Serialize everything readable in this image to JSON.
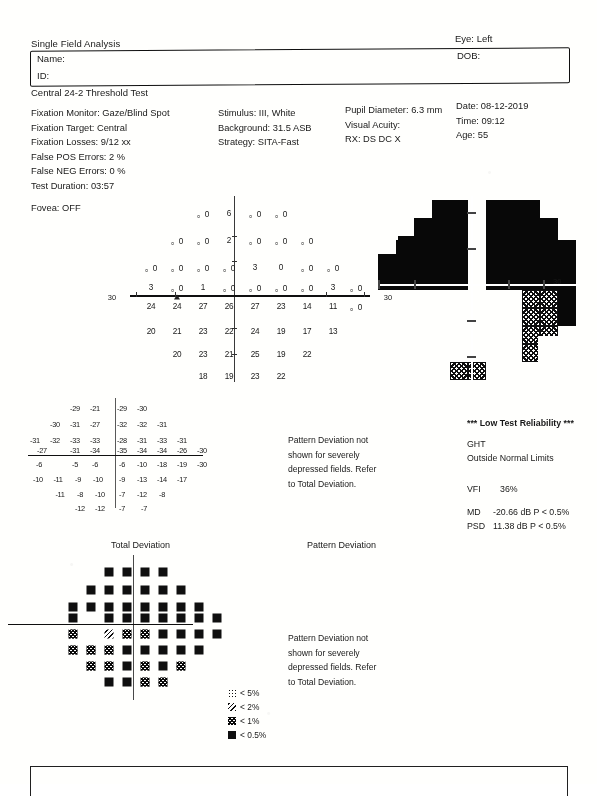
{
  "header": {
    "analysis_title": "Single Field Analysis",
    "eye_label": "Eye: Left",
    "name_label": "Name:",
    "id_label": "ID:",
    "dob_label": "DOB:",
    "test_name": "Central 24-2 Threshold Test"
  },
  "params": {
    "col1": [
      "Fixation Monitor: Gaze/Blind Spot",
      "Fixation Target: Central",
      "Fixation Losses: 9/12 xx",
      "False POS Errors:  2 %",
      "False NEG Errors:  0 %",
      "Test Duration: 03:57"
    ],
    "fovea": "Fovea: OFF",
    "col2": [
      "Stimulus: III, White",
      "Background: 31.5 ASB",
      "Strategy: SITA-Fast"
    ],
    "col3": [
      "Pupil Diameter: 6.3 mm",
      "Visual Acuity:",
      "RX:      DS        DC X"
    ],
    "col4": [
      "Date: 08-12-2019",
      "Time: 09:12",
      "Age: 55"
    ]
  },
  "threshold_plot": {
    "axis_label_left": "30",
    "axis_label_right": "30",
    "blind_spot_marker": "triangle",
    "rows": [
      {
        "y": 17,
        "cells": [
          {
            "x": 73,
            "v": "。0"
          },
          {
            "x": 99,
            "v": "6"
          },
          {
            "x": 125,
            "v": "。0"
          },
          {
            "x": 151,
            "v": "。0"
          }
        ]
      },
      {
        "y": 44,
        "cells": [
          {
            "x": 47,
            "v": "。0"
          },
          {
            "x": 73,
            "v": "。0"
          },
          {
            "x": 99,
            "v": "2"
          },
          {
            "x": 125,
            "v": "。0"
          },
          {
            "x": 151,
            "v": "。0"
          },
          {
            "x": 177,
            "v": "。0"
          }
        ]
      },
      {
        "y": 71,
        "cells": [
          {
            "x": 21,
            "v": "。0"
          },
          {
            "x": 47,
            "v": "。0"
          },
          {
            "x": 73,
            "v": "。0"
          },
          {
            "x": 99,
            "v": "。0"
          },
          {
            "x": 125,
            "v": "3"
          },
          {
            "x": 151,
            "v": "0"
          },
          {
            "x": 177,
            "v": "。0"
          },
          {
            "x": 203,
            "v": "。0"
          }
        ]
      },
      {
        "y": 91,
        "cells": [
          {
            "x": 21,
            "v": "3"
          },
          {
            "x": 47,
            "v": "。0"
          },
          {
            "x": 73,
            "v": "1"
          },
          {
            "x": 99,
            "v": "。0"
          },
          {
            "x": 125,
            "v": "。0"
          },
          {
            "x": 151,
            "v": "。0"
          },
          {
            "x": 177,
            "v": "。0"
          },
          {
            "x": 203,
            "v": "3"
          },
          {
            "x": 226,
            "v": "。0"
          }
        ]
      },
      {
        "y": 110,
        "cells": [
          {
            "x": 21,
            "v": "24"
          },
          {
            "x": 47,
            "v": "24"
          },
          {
            "x": 73,
            "v": "27"
          },
          {
            "x": 99,
            "v": "26"
          },
          {
            "x": 125,
            "v": "27"
          },
          {
            "x": 151,
            "v": "23"
          },
          {
            "x": 177,
            "v": "14"
          },
          {
            "x": 203,
            "v": "11"
          },
          {
            "x": 226,
            "v": "。0"
          }
        ]
      },
      {
        "y": 135,
        "cells": [
          {
            "x": 21,
            "v": "20"
          },
          {
            "x": 47,
            "v": "21"
          },
          {
            "x": 73,
            "v": "23"
          },
          {
            "x": 99,
            "v": "22"
          },
          {
            "x": 125,
            "v": "24"
          },
          {
            "x": 151,
            "v": "19"
          },
          {
            "x": 177,
            "v": "17"
          },
          {
            "x": 203,
            "v": "13"
          }
        ]
      },
      {
        "y": 158,
        "cells": [
          {
            "x": 47,
            "v": "20"
          },
          {
            "x": 73,
            "v": "23"
          },
          {
            "x": 99,
            "v": "21"
          },
          {
            "x": 125,
            "v": "25"
          },
          {
            "x": 151,
            "v": "19"
          },
          {
            "x": 177,
            "v": "22"
          }
        ]
      },
      {
        "y": 180,
        "cells": [
          {
            "x": 73,
            "v": "18"
          },
          {
            "x": 99,
            "v": "19"
          },
          {
            "x": 125,
            "v": "23"
          },
          {
            "x": 151,
            "v": "22"
          }
        ]
      }
    ]
  },
  "grayscale": {
    "degree_label": "30",
    "description": "Dense superior hemifield defect with inferior relative sparing"
  },
  "total_deviation_numeric": {
    "rows": [
      {
        "y": 10,
        "cells": [
          {
            "x": 57,
            "v": "-29"
          },
          {
            "x": 77,
            "v": "-21"
          },
          {
            "x": 104,
            "v": "-29"
          },
          {
            "x": 124,
            "v": "-30"
          }
        ]
      },
      {
        "y": 26,
        "cells": [
          {
            "x": 37,
            "v": "-30"
          },
          {
            "x": 57,
            "v": "-31"
          },
          {
            "x": 77,
            "v": "-27"
          },
          {
            "x": 104,
            "v": "-32"
          },
          {
            "x": 124,
            "v": "-32"
          },
          {
            "x": 144,
            "v": "-31"
          }
        ]
      },
      {
        "y": 42,
        "cells": [
          {
            "x": 17,
            "v": "-31"
          },
          {
            "x": 37,
            "v": "-32"
          },
          {
            "x": 57,
            "v": "-33"
          },
          {
            "x": 77,
            "v": "-33"
          },
          {
            "x": 104,
            "v": "-28"
          },
          {
            "x": 124,
            "v": "-31"
          },
          {
            "x": 144,
            "v": "-33"
          },
          {
            "x": 164,
            "v": "-31"
          }
        ]
      },
      {
        "y": 52,
        "cells": [
          {
            "x": 24,
            "v": "-27"
          },
          {
            "x": 57,
            "v": "-31"
          },
          {
            "x": 77,
            "v": "-34"
          },
          {
            "x": 104,
            "v": "-35"
          },
          {
            "x": 124,
            "v": "-34"
          },
          {
            "x": 144,
            "v": "-34"
          },
          {
            "x": 164,
            "v": "-26"
          },
          {
            "x": 184,
            "v": "-30"
          }
        ]
      },
      {
        "y": 66,
        "cells": [
          {
            "x": 21,
            "v": "-6"
          },
          {
            "x": 57,
            "v": "-5"
          },
          {
            "x": 77,
            "v": "-6"
          },
          {
            "x": 104,
            "v": "-6"
          },
          {
            "x": 124,
            "v": "-10"
          },
          {
            "x": 144,
            "v": "-18"
          },
          {
            "x": 164,
            "v": "-19"
          },
          {
            "x": 184,
            "v": "-30"
          }
        ]
      },
      {
        "y": 81,
        "cells": [
          {
            "x": 20,
            "v": "-10"
          },
          {
            "x": 40,
            "v": "-11"
          },
          {
            "x": 60,
            "v": "-9"
          },
          {
            "x": 80,
            "v": "-10"
          },
          {
            "x": 104,
            "v": "-9"
          },
          {
            "x": 124,
            "v": "-13"
          },
          {
            "x": 144,
            "v": "-14"
          },
          {
            "x": 164,
            "v": "-17"
          }
        ]
      },
      {
        "y": 96,
        "cells": [
          {
            "x": 42,
            "v": "-11"
          },
          {
            "x": 62,
            "v": "-8"
          },
          {
            "x": 82,
            "v": "-10"
          },
          {
            "x": 104,
            "v": "-7"
          },
          {
            "x": 124,
            "v": "-12"
          },
          {
            "x": 144,
            "v": "-8"
          }
        ]
      },
      {
        "y": 110,
        "cells": [
          {
            "x": 62,
            "v": "-12"
          },
          {
            "x": 82,
            "v": "-12"
          },
          {
            "x": 104,
            "v": "-7"
          },
          {
            "x": 126,
            "v": "-7"
          }
        ]
      }
    ]
  },
  "notes": {
    "pattern_deviation_note": [
      "Pattern Deviation not",
      "shown for severely",
      "depressed fields. Refer",
      "to Total Deviation."
    ]
  },
  "results": {
    "reliability": "*** Low Test Reliability ***",
    "ght_label": "GHT",
    "ght_value": "Outside Normal Limits",
    "vfi_label": "VFI",
    "vfi_value": "36%",
    "md_label": "MD",
    "md_value": "-20.66 dB  P < 0.5%",
    "psd_label": "PSD",
    "psd_value": "11.38 dB  P < 0.5%"
  },
  "section_titles": {
    "total_deviation": "Total Deviation",
    "pattern_deviation": "Pattern Deviation"
  },
  "td_symbols": {
    "rows": [
      {
        "y": 12,
        "cells": [
          {
            "x": 54,
            "p": "p05"
          },
          {
            "x": 72,
            "p": "p05"
          },
          {
            "x": 90,
            "p": "p05"
          },
          {
            "x": 108,
            "p": "p05"
          }
        ]
      },
      {
        "y": 30,
        "cells": [
          {
            "x": 36,
            "p": "p05"
          },
          {
            "x": 54,
            "p": "p05"
          },
          {
            "x": 72,
            "p": "p05"
          },
          {
            "x": 90,
            "p": "p05"
          },
          {
            "x": 108,
            "p": "p05"
          },
          {
            "x": 126,
            "p": "p05"
          }
        ]
      },
      {
        "y": 47,
        "cells": [
          {
            "x": 18,
            "p": "p05"
          },
          {
            "x": 36,
            "p": "p05"
          },
          {
            "x": 54,
            "p": "p05"
          },
          {
            "x": 72,
            "p": "p05"
          },
          {
            "x": 90,
            "p": "p05"
          },
          {
            "x": 108,
            "p": "p05"
          },
          {
            "x": 126,
            "p": "p05"
          },
          {
            "x": 144,
            "p": "p05"
          }
        ]
      },
      {
        "y": 58,
        "cells": [
          {
            "x": 18,
            "p": "p05"
          },
          {
            "x": 54,
            "p": "p05"
          },
          {
            "x": 72,
            "p": "p05"
          },
          {
            "x": 90,
            "p": "p05"
          },
          {
            "x": 108,
            "p": "p05"
          },
          {
            "x": 126,
            "p": "p05"
          },
          {
            "x": 144,
            "p": "p05"
          },
          {
            "x": 162,
            "p": "p05"
          }
        ]
      },
      {
        "y": 74,
        "cells": [
          {
            "x": 18,
            "p": "p1"
          },
          {
            "x": 54,
            "p": "p2"
          },
          {
            "x": 72,
            "p": "p1"
          },
          {
            "x": 90,
            "p": "p1"
          },
          {
            "x": 108,
            "p": "p05"
          },
          {
            "x": 126,
            "p": "p05"
          },
          {
            "x": 144,
            "p": "p05"
          },
          {
            "x": 162,
            "p": "p05"
          }
        ]
      },
      {
        "y": 90,
        "cells": [
          {
            "x": 18,
            "p": "p1"
          },
          {
            "x": 36,
            "p": "p1"
          },
          {
            "x": 54,
            "p": "p1"
          },
          {
            "x": 72,
            "p": "p05"
          },
          {
            "x": 90,
            "p": "p05"
          },
          {
            "x": 108,
            "p": "p05"
          },
          {
            "x": 126,
            "p": "p05"
          },
          {
            "x": 144,
            "p": "p05"
          }
        ]
      },
      {
        "y": 106,
        "cells": [
          {
            "x": 36,
            "p": "p1"
          },
          {
            "x": 54,
            "p": "p1"
          },
          {
            "x": 72,
            "p": "p05"
          },
          {
            "x": 90,
            "p": "p1"
          },
          {
            "x": 108,
            "p": "p05"
          },
          {
            "x": 126,
            "p": "p1"
          }
        ]
      },
      {
        "y": 122,
        "cells": [
          {
            "x": 54,
            "p": "p05"
          },
          {
            "x": 72,
            "p": "p05"
          },
          {
            "x": 90,
            "p": "p1"
          },
          {
            "x": 108,
            "p": "p1"
          }
        ]
      }
    ]
  },
  "probability_legend": [
    {
      "symbol": "p5",
      "label": "< 5%"
    },
    {
      "symbol": "p2",
      "label": "< 2%"
    },
    {
      "symbol": "p1",
      "label": "< 1%"
    },
    {
      "symbol": "p05",
      "label": "< 0.5%"
    }
  ]
}
